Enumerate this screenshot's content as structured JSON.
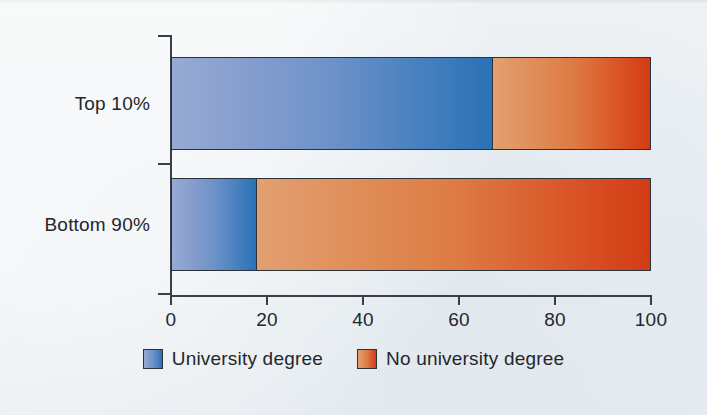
{
  "chart_data": {
    "type": "bar",
    "orientation": "horizontal",
    "stacked": true,
    "title": "",
    "subtitle": "",
    "xlabel": "",
    "ylabel": "",
    "categories": [
      "Top 10%",
      "Bottom 90%"
    ],
    "series": [
      {
        "name": "University degree",
        "values": [
          67,
          17.5
        ],
        "color": "#4780bf"
      },
      {
        "name": "No university degree",
        "values": [
          33,
          82.5
        ],
        "color": "#d9581f"
      }
    ],
    "xlim": [
      0,
      100
    ],
    "xticks": [
      0,
      20,
      40,
      60,
      80,
      100
    ],
    "xtick_labels": [
      "0",
      "20",
      "40",
      "60",
      "80",
      "100"
    ],
    "grid": false,
    "legend_position": "bottom-center",
    "annotations": []
  },
  "legend": {
    "items": [
      {
        "label": "University degree",
        "swatch": "blue-gradient-swatch"
      },
      {
        "label": "No university degree",
        "swatch": "orange-gradient-swatch"
      }
    ]
  },
  "colors": {
    "blue_light": "#97aad4",
    "blue_dark": "#2a71b6",
    "orange_light": "#e3a071",
    "orange_dark": "#d23c14",
    "axis": "#3a3f45",
    "text": "#23272b",
    "background": "#eef2f6"
  }
}
